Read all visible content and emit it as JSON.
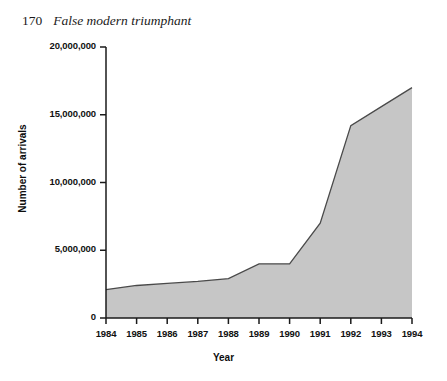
{
  "page": {
    "folio": "170",
    "running_title": "False modern triumphant"
  },
  "chart_data": {
    "type": "area",
    "title": "",
    "xlabel": "Year",
    "ylabel": "Number of arrivals",
    "categories": [
      "1984",
      "1985",
      "1986",
      "1987",
      "1988",
      "1989",
      "1990",
      "1991",
      "1992",
      "1993",
      "1994"
    ],
    "x": [
      1984,
      1985,
      1986,
      1987,
      1988,
      1989,
      1990,
      1991,
      1992,
      1993,
      1994
    ],
    "values": [
      2100000,
      2400000,
      2550000,
      2700000,
      2900000,
      4000000,
      4000000,
      7000000,
      14200000,
      15600000,
      17000000
    ],
    "ylim": [
      0,
      20000000
    ],
    "xlim": [
      1984,
      1994
    ],
    "y_ticks": [
      0,
      5000000,
      10000000,
      15000000,
      20000000
    ],
    "y_tick_labels": [
      "0",
      "5,000,000",
      "10,000,000",
      "15,000,000",
      "20,000,000"
    ],
    "x_ticks": [
      1984,
      1985,
      1986,
      1987,
      1988,
      1989,
      1990,
      1991,
      1992,
      1993,
      1994
    ],
    "x_tick_labels": [
      "1984",
      "1985",
      "1986",
      "1987",
      "1988",
      "1989",
      "1990",
      "1991",
      "1992",
      "1993",
      "1994"
    ],
    "grid": false,
    "legend": null,
    "colors": {
      "fill": "#c6c6c6",
      "line": "#3b3b3b",
      "axis": "#1a1a1a",
      "text": "#111111",
      "background": "#ffffff"
    }
  }
}
